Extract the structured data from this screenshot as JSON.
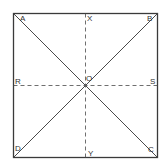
{
  "diagram": {
    "type": "square-with-diagonals-and-midlines",
    "stroke_color": "#3a3a3a",
    "labels": {
      "A": "A",
      "B": "B",
      "C": "C",
      "D": "D",
      "O": "O",
      "X": "X",
      "Y": "Y",
      "R": "R",
      "S": "S"
    }
  }
}
